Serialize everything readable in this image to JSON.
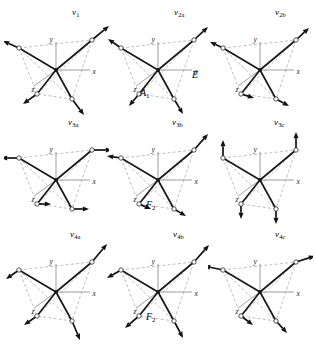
{
  "figure": {
    "caption_present": false,
    "background_color": "#ffffff",
    "ink_color": "#111111",
    "dashed_color": "#8a8a8a",
    "axis_color": "#777777",
    "rows": 3,
    "columns": 3
  },
  "axes": {
    "x_label": "x",
    "y_label": "y",
    "z_label": "z"
  },
  "symmetry_labels": [
    {
      "id": "sym-a1",
      "text": "A",
      "sub": "1",
      "x": 140,
      "y": 88
    },
    {
      "id": "sym-e",
      "text": "E",
      "sub": "",
      "x": 192,
      "y": 70
    },
    {
      "id": "sym-f2-mid",
      "text": "F",
      "sub": "2",
      "x": 146,
      "y": 200
    },
    {
      "id": "sym-f2-bottom",
      "text": "F",
      "sub": "2",
      "x": 146,
      "y": 312
    }
  ],
  "panels": [
    {
      "id": "panel-v1",
      "mode": "v",
      "sub": "1",
      "label_x": 72,
      "label_y": 8,
      "symmetry": "A1",
      "arrow_style": "radial-outward",
      "description": "symmetric stretch"
    },
    {
      "id": "panel-v2a",
      "mode": "v",
      "sub": "2a",
      "label_x": 174,
      "label_y": 8,
      "symmetry": "E",
      "arrow_style": "bend-2a",
      "description": "doubly degenerate bend a"
    },
    {
      "id": "panel-v2b",
      "mode": "v",
      "sub": "2b",
      "label_x": 275,
      "label_y": 8,
      "symmetry": "E",
      "arrow_style": "bend-2b",
      "description": "doubly degenerate bend b"
    },
    {
      "id": "panel-v3a",
      "mode": "v",
      "sub": "3a",
      "label_x": 68,
      "label_y": 118,
      "symmetry": "F2",
      "arrow_style": "translation-x",
      "description": "triply degenerate stretch a"
    },
    {
      "id": "panel-v3b",
      "mode": "v",
      "sub": "3b",
      "label_x": 172,
      "label_y": 118,
      "symmetry": "F2",
      "arrow_style": "translation-diag",
      "description": "triply degenerate stretch b"
    },
    {
      "id": "panel-v3c",
      "mode": "v",
      "sub": "3c",
      "label_x": 274,
      "label_y": 118,
      "symmetry": "F2",
      "arrow_style": "translation-y",
      "description": "triply degenerate stretch c"
    },
    {
      "id": "panel-v4a",
      "mode": "v",
      "sub": "4a",
      "label_x": 70,
      "label_y": 230,
      "symmetry": "F2",
      "arrow_style": "bend-4a",
      "description": "triply degenerate bend a"
    },
    {
      "id": "panel-v4b",
      "mode": "v",
      "sub": "4b",
      "label_x": 173,
      "label_y": 230,
      "symmetry": "F2",
      "arrow_style": "bend-4b",
      "description": "triply degenerate bend b"
    },
    {
      "id": "panel-v4c",
      "mode": "v",
      "sub": "4c",
      "label_x": 275,
      "label_y": 230,
      "symmetry": "F2",
      "arrow_style": "bend-4c",
      "description": "triply degenerate bend c"
    }
  ],
  "geometry": {
    "center": [
      52,
      56
    ],
    "vertices": {
      "top_right": [
        88,
        26
      ],
      "top_left": [
        15,
        34
      ],
      "bottom_left": [
        33,
        80
      ],
      "bottom_right": [
        68,
        85
      ]
    },
    "axis_x_end": [
      86,
      56
    ],
    "axis_y_end": [
      52,
      28
    ],
    "axis_z_end": [
      30,
      72
    ]
  },
  "arrow_sets": {
    "radial-outward": [
      {
        "vertex": "top_right",
        "dx": 17,
        "dy": -14
      },
      {
        "vertex": "top_left",
        "dx": -16,
        "dy": -7
      },
      {
        "vertex": "bottom_left",
        "dx": -14,
        "dy": 10
      },
      {
        "vertex": "bottom_right",
        "dx": 12,
        "dy": 16
      }
    ],
    "bend-2a": [
      {
        "vertex": "top_right",
        "dx": 14,
        "dy": -13
      },
      {
        "vertex": "top_left",
        "dx": -13,
        "dy": -9
      },
      {
        "vertex": "bottom_left",
        "dx": -10,
        "dy": 12
      },
      {
        "vertex": "bottom_right",
        "dx": 9,
        "dy": 15
      }
    ],
    "bend-2b": [
      {
        "vertex": "top_right",
        "dx": 13,
        "dy": -12
      },
      {
        "vertex": "top_left",
        "dx": -13,
        "dy": -6
      },
      {
        "vertex": "bottom_left",
        "dx": 13,
        "dy": 4
      },
      {
        "vertex": "bottom_right",
        "dx": 13,
        "dy": 7
      }
    ],
    "translation-x": [
      {
        "vertex": "top_right",
        "dx": 20,
        "dy": 0
      },
      {
        "vertex": "top_left",
        "dx": -18,
        "dy": 0
      },
      {
        "vertex": "bottom_left",
        "dx": 14,
        "dy": 0
      },
      {
        "vertex": "bottom_right",
        "dx": 17,
        "dy": 0
      }
    ],
    "translation-diag": [
      {
        "vertex": "top_right",
        "dx": 14,
        "dy": -16
      },
      {
        "vertex": "top_left",
        "dx": -14,
        "dy": -2
      },
      {
        "vertex": "bottom_left",
        "dx": 12,
        "dy": 5
      },
      {
        "vertex": "bottom_right",
        "dx": 12,
        "dy": 7
      }
    ],
    "translation-y": [
      {
        "vertex": "top_right",
        "dx": 0,
        "dy": -18
      },
      {
        "vertex": "top_left",
        "dx": 0,
        "dy": -18
      },
      {
        "vertex": "bottom_left",
        "dx": 0,
        "dy": 15
      },
      {
        "vertex": "bottom_right",
        "dx": 0,
        "dy": 15
      }
    ],
    "bend-4a": [
      {
        "vertex": "top_right",
        "dx": 15,
        "dy": -18
      },
      {
        "vertex": "top_left",
        "dx": -13,
        "dy": 9
      },
      {
        "vertex": "bottom_left",
        "dx": -13,
        "dy": 9
      },
      {
        "vertex": "bottom_right",
        "dx": 8,
        "dy": 19
      }
    ],
    "bend-4b": [
      {
        "vertex": "top_right",
        "dx": 15,
        "dy": -17
      },
      {
        "vertex": "top_left",
        "dx": -14,
        "dy": 8
      },
      {
        "vertex": "bottom_left",
        "dx": -14,
        "dy": 12
      },
      {
        "vertex": "bottom_right",
        "dx": 9,
        "dy": 17
      }
    ],
    "bend-4c": [
      {
        "vertex": "top_right",
        "dx": 19,
        "dy": -6
      },
      {
        "vertex": "top_left",
        "dx": -19,
        "dy": -4
      },
      {
        "vertex": "bottom_left",
        "dx": 12,
        "dy": 9
      },
      {
        "vertex": "bottom_right",
        "dx": 11,
        "dy": 12
      }
    ]
  }
}
